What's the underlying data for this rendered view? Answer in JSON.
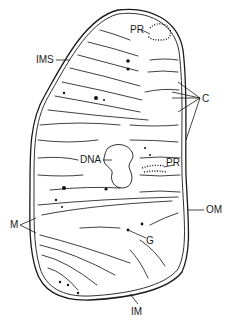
{
  "figure": {
    "labels": {
      "pr_top": "PR",
      "ims": "IMS",
      "c": "C",
      "dna": "DNA",
      "pr_mid": "PR",
      "m": "M",
      "om": "OM",
      "g": "G",
      "im": "IM"
    },
    "colors": {
      "line": "#1a1a1a",
      "background": "#ffffff"
    }
  }
}
